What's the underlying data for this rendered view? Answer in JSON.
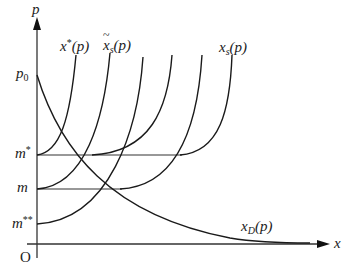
{
  "diagram": {
    "axes": {
      "y_label": "p",
      "x_label": "x",
      "origin_label": "O"
    },
    "y_ticks": [
      {
        "id": "p0",
        "base": "p",
        "sub": "0",
        "sup": ""
      },
      {
        "id": "m_star",
        "base": "m",
        "sub": "",
        "sup": "*"
      },
      {
        "id": "m",
        "base": "m",
        "sub": "",
        "sup": ""
      },
      {
        "id": "m_double_star",
        "base": "m",
        "sub": "",
        "sup": "**"
      }
    ],
    "curve_labels": {
      "x_star": {
        "base": "x",
        "sup": "*",
        "arg": "(p)"
      },
      "x_tilde_s": {
        "base": "x",
        "sub": "s",
        "arg": "(p)",
        "accent": "tilde"
      },
      "x_s": {
        "base": "x",
        "sub": "s",
        "arg": "(p)"
      },
      "x_D": {
        "base": "x",
        "sub": "D",
        "arg": "(p)"
      }
    },
    "stroke_color": "#1a1a1a",
    "axis_color": "#333333"
  }
}
